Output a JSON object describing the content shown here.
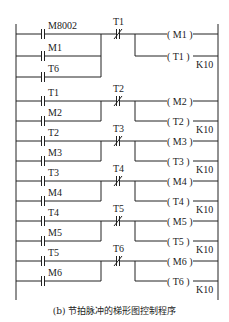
{
  "diagram": {
    "type": "ladder",
    "caption": "(b) 节拍脉冲的梯形图控制程序",
    "rails": {
      "left_x": 16,
      "right_x": 218
    },
    "rungs": [
      {
        "id": 1,
        "contacts_no": [
          "M8002",
          "M1",
          "T6"
        ],
        "contact_nc": "T1",
        "coils": [
          {
            "name": "M1",
            "text": "( M1 )"
          },
          {
            "name": "T1",
            "text": "( T1 )",
            "preset": "K10"
          }
        ]
      },
      {
        "id": 2,
        "contacts_no": [
          "T1",
          "M2"
        ],
        "contact_nc": "T2",
        "coils": [
          {
            "name": "M2",
            "text": "( M2 )"
          },
          {
            "name": "T2",
            "text": "( T2 )",
            "preset": "K10"
          }
        ]
      },
      {
        "id": 3,
        "contacts_no": [
          "T2",
          "M3"
        ],
        "contact_nc": "T3",
        "coils": [
          {
            "name": "M3",
            "text": "( M3 )"
          },
          {
            "name": "T3",
            "text": "( T3 )",
            "preset": "K10"
          }
        ]
      },
      {
        "id": 4,
        "contacts_no": [
          "T3",
          "M4"
        ],
        "contact_nc": "T4",
        "coils": [
          {
            "name": "M4",
            "text": "( M4 )"
          },
          {
            "name": "T4",
            "text": "( T4 )",
            "preset": "K10"
          }
        ]
      },
      {
        "id": 5,
        "contacts_no": [
          "T4",
          "M5"
        ],
        "contact_nc": "T5",
        "coils": [
          {
            "name": "M5",
            "text": "( M5 )"
          },
          {
            "name": "T5",
            "text": "( T5 )",
            "preset": "K10"
          }
        ]
      },
      {
        "id": 6,
        "contacts_no": [
          "T5",
          "M6"
        ],
        "contact_nc": "T6",
        "coils": [
          {
            "name": "M6",
            "text": "( M6 )"
          },
          {
            "name": "T6",
            "text": "( T6 )",
            "preset": "K10"
          }
        ]
      }
    ]
  }
}
